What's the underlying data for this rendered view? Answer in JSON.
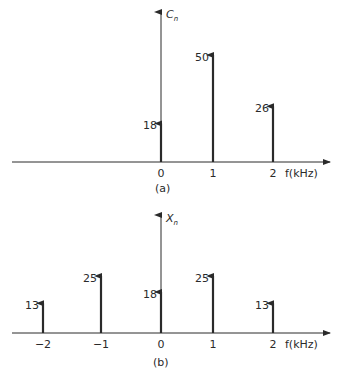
{
  "chart_data": [
    {
      "type": "bar",
      "subtype": "stem/line-spectrum",
      "panel_label": "(a)",
      "ylabel": "C",
      "ylabel_sub": "n",
      "xlabel": "f(kHz)",
      "categories": [
        "0",
        "1",
        "2"
      ],
      "x": [
        0,
        1,
        2
      ],
      "values": [
        18,
        50,
        26
      ],
      "value_labels": [
        "18",
        "50",
        "26"
      ],
      "grid": false
    },
    {
      "type": "bar",
      "subtype": "stem/line-spectrum",
      "panel_label": "(b)",
      "ylabel": "X",
      "ylabel_sub": "n",
      "xlabel": "f(kHz)",
      "categories": [
        "-2",
        "-1",
        "0",
        "1",
        "2"
      ],
      "x": [
        -2,
        -1,
        0,
        1,
        2
      ],
      "values": [
        13,
        25,
        18,
        25,
        13
      ],
      "value_labels": [
        "13",
        "25",
        "18",
        "25",
        "13"
      ],
      "tick_labels": [
        "−2",
        "−1",
        "0",
        "1",
        "2"
      ],
      "grid": false
    }
  ]
}
